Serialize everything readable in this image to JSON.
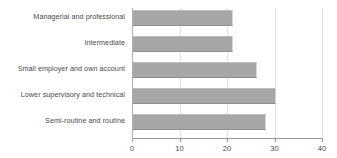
{
  "chart_data": {
    "type": "bar",
    "orientation": "horizontal",
    "title": "",
    "subtitle": "",
    "xlabel": "",
    "ylabel": "",
    "xlim": [
      0,
      40
    ],
    "xticks": [
      0,
      10,
      20,
      30,
      40
    ],
    "xtick_labels": [
      "0",
      "10",
      "20",
      "30",
      "40"
    ],
    "grid": true,
    "legend": null,
    "bar_color": "#a6a6a6",
    "text_color": "#4a4a4a",
    "axis_color": "#9a9a9a",
    "categories": [
      "Managerial and professional",
      "Intermediate",
      "Small employer and own account",
      "Lower supervisory and technical",
      "Semi-routine and routine"
    ],
    "values": [
      21,
      21,
      26,
      30,
      28
    ]
  }
}
